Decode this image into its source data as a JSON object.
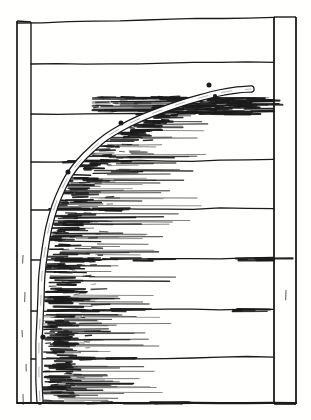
{
  "illustration": {
    "alt": "Old engraved line drawing of a young tree stem bent into a quarter arc and nailed against a fence of horizontal boards, with hatched shading trailing to the right of the curve",
    "canvas": {
      "width": 311,
      "height": 420
    },
    "background_color": "#fffffe",
    "ink_color": "#1b1b1b",
    "fence": {
      "left_post": {
        "outer_x": 17,
        "inner_x": 31,
        "top_y": 21,
        "bottom_y": 403
      },
      "right_post": {
        "inner_x": 274,
        "outer_x": 296,
        "top_y": 17,
        "bottom_y": 404
      },
      "top_rail": {
        "x0": 17,
        "y0": 23,
        "x1": 274,
        "y1": 17
      },
      "bottom_rail": {
        "x0": 17,
        "y0": 403,
        "x1": 296,
        "y1": 403
      },
      "plank_line_ys": [
        63,
        113,
        161,
        209,
        259,
        310,
        358
      ],
      "plank_x0": 31,
      "plank_x1": 274
    },
    "branch": {
      "outer_width": 7.4,
      "inner_width": 4.9,
      "centerline": [
        [
          40,
          401
        ],
        [
          39,
          382
        ],
        [
          39,
          362
        ],
        [
          39,
          342
        ],
        [
          40,
          320
        ],
        [
          41,
          297
        ],
        [
          42,
          274
        ],
        [
          45,
          250
        ],
        [
          49,
          227
        ],
        [
          55,
          206
        ],
        [
          62,
          189
        ],
        [
          70,
          174
        ],
        [
          80,
          161
        ],
        [
          92,
          149
        ],
        [
          105,
          138
        ],
        [
          121,
          128
        ],
        [
          139,
          119
        ],
        [
          159,
          111
        ],
        [
          179,
          104
        ],
        [
          199,
          98
        ],
        [
          219,
          93
        ],
        [
          237,
          90
        ],
        [
          251,
          89
        ]
      ],
      "edge_by_y": [
        [
          95,
          262
        ],
        [
          99,
          205
        ],
        [
          110,
          168
        ],
        [
          121,
          138
        ],
        [
          135,
          112
        ],
        [
          150,
          90
        ],
        [
          166,
          74
        ],
        [
          184,
          62
        ],
        [
          202,
          54
        ],
        [
          222,
          48
        ],
        [
          242,
          45
        ],
        [
          262,
          43
        ],
        [
          282,
          42
        ],
        [
          302,
          41
        ],
        [
          322,
          41
        ],
        [
          342,
          42
        ],
        [
          362,
          41
        ],
        [
          382,
          41
        ],
        [
          402,
          41
        ]
      ]
    },
    "buds": [
      [
        209,
        85,
        2.5
      ],
      [
        215,
        96,
        2.1
      ],
      [
        121,
        123,
        2.5
      ],
      [
        132,
        131,
        1.9
      ],
      [
        68,
        172,
        2.5
      ],
      [
        43,
        337,
        2.6
      ]
    ],
    "shading": {
      "seed": 12345,
      "bands": [
        {
          "y0": 96,
          "y1": 112,
          "x0": 92,
          "x1": 286,
          "count": 55,
          "core": {
            "count": 62,
            "cx0": 150,
            "cx1": 280
          }
        },
        {
          "y0": 115,
          "y1": 158,
          "follow": true,
          "x1": 215,
          "count": 50,
          "core": {
            "count": 30
          }
        },
        {
          "y0": 163,
          "y1": 207,
          "follow": true,
          "x1": 205,
          "count": 45,
          "core": {
            "count": 28
          }
        },
        {
          "y0": 212,
          "y1": 257,
          "follow": true,
          "x1": 195,
          "count": 45,
          "core": {
            "count": 30
          }
        },
        {
          "y0": 261,
          "y1": 307,
          "follow": true,
          "x1": 180,
          "count": 48,
          "core": {
            "count": 34
          }
        },
        {
          "y0": 312,
          "y1": 356,
          "follow": true,
          "x1": 168,
          "count": 45,
          "core": {
            "count": 30
          }
        },
        {
          "y0": 361,
          "y1": 401,
          "follow": true,
          "x1": 160,
          "count": 45,
          "core": {
            "count": 28
          }
        }
      ],
      "line_clusters": [
        {
          "y": 113,
          "x0": 130,
          "x1": 235,
          "count": 12
        },
        {
          "y": 161,
          "x0": 56,
          "x1": 128,
          "count": 8
        },
        {
          "y": 209,
          "x0": 48,
          "x1": 150,
          "count": 10
        },
        {
          "y": 259,
          "x0": 45,
          "x1": 165,
          "count": 12
        },
        {
          "y": 259,
          "x0": 226,
          "x1": 278,
          "count": 6
        },
        {
          "y": 310,
          "x0": 42,
          "x1": 128,
          "count": 9
        },
        {
          "y": 310,
          "x0": 228,
          "x1": 252,
          "count": 4
        },
        {
          "y": 358,
          "x0": 41,
          "x1": 126,
          "count": 8
        },
        {
          "y": 403,
          "x0": 44,
          "x1": 170,
          "count": 10
        }
      ],
      "post_grain": [
        [
          23,
          255
        ],
        [
          25,
          292
        ],
        [
          22,
          330
        ],
        [
          26,
          364
        ],
        [
          23,
          394
        ],
        [
          286,
          290
        ]
      ]
    }
  }
}
